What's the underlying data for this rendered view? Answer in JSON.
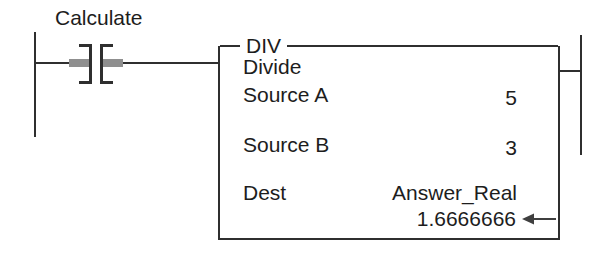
{
  "figure": {
    "kind": "ladder-logic-rung",
    "colors": {
      "background": "#ffffff",
      "line": "#2f2f2f",
      "text": "#1d1d1d",
      "contact_highlight_bar": "#8f8f8f"
    },
    "rung": {
      "contact_label": "Calculate",
      "contact_type": "normally-open-contact"
    },
    "block": {
      "title": "DIV",
      "description": "Divide",
      "params": [
        {
          "label": "Source A",
          "value": "5"
        },
        {
          "label": "Source B",
          "value": "3"
        },
        {
          "label": "Dest",
          "value": "Answer_Real"
        }
      ],
      "result_value": "1.6666666",
      "icons": {
        "result_pointer": "left-arrow"
      }
    }
  }
}
